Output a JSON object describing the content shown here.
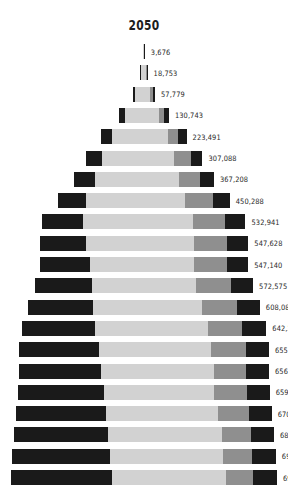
{
  "chart": {
    "title": "2050",
    "axis_center_x": 144,
    "label_gap": 6
  },
  "colors": {
    "background": "#ffffff",
    "segment_dark": "#1a1a1a",
    "segment_light": "#d2d2d2",
    "segment_mid": "#8f8f8f",
    "label_text": "#2a2a2a",
    "title_text": "#1d1d1d"
  },
  "chart_data": {
    "type": "bar",
    "title": "2050",
    "subtitle": "",
    "xlabel": "",
    "ylabel": "",
    "orientation": "horizontal",
    "layout": "centered-pyramid",
    "grid": false,
    "legend": null,
    "axis_ticks": [],
    "xlim": [
      0,
      698304
    ],
    "categories": [
      "row-1",
      "row-2",
      "row-3",
      "row-4",
      "row-5",
      "row-6",
      "row-7",
      "row-8",
      "row-9",
      "row-10",
      "row-11",
      "row-12",
      "row-13",
      "row-14",
      "row-15",
      "row-16",
      "row-17",
      "row-18",
      "row-19",
      "row-20",
      "row-21"
    ],
    "values": [
      3676,
      18753,
      57779,
      130743,
      223491,
      307088,
      367208,
      450288,
      532941,
      547628,
      547140,
      572575,
      608082,
      642222,
      655950,
      656443,
      659946,
      670303,
      682424,
      692165,
      698304
    ],
    "value_labels": [
      "3,676",
      "18,753",
      "57,779",
      "130,743",
      "223,491",
      "307,088",
      "367,208",
      "450,288",
      "532,941",
      "547,628",
      "547,140",
      "572,575",
      "608,082",
      "642,222",
      "655,950",
      "656,443",
      "659,946",
      "670,303",
      "682,424",
      "692,165",
      "698,304"
    ],
    "segment_names": [
      "dark-left",
      "light-middle",
      "mid-gray",
      "dark-right"
    ],
    "segment_fractions": [
      [
        0.0,
        0.74,
        0.0,
        0.26
      ],
      [
        0.1,
        0.66,
        0.1,
        0.14
      ],
      [
        0.11,
        0.66,
        0.13,
        0.1
      ],
      [
        0.11,
        0.7,
        0.1,
        0.09
      ],
      [
        0.12,
        0.66,
        0.12,
        0.1
      ],
      [
        0.14,
        0.62,
        0.14,
        0.1
      ],
      [
        0.15,
        0.6,
        0.15,
        0.1
      ],
      [
        0.16,
        0.58,
        0.16,
        0.1
      ],
      [
        0.2,
        0.54,
        0.16,
        0.1
      ],
      [
        0.22,
        0.52,
        0.16,
        0.1
      ],
      [
        0.24,
        0.5,
        0.16,
        0.1
      ],
      [
        0.26,
        0.48,
        0.16,
        0.1
      ],
      [
        0.28,
        0.47,
        0.15,
        0.1
      ],
      [
        0.3,
        0.46,
        0.14,
        0.1
      ],
      [
        0.32,
        0.45,
        0.14,
        0.09
      ],
      [
        0.33,
        0.45,
        0.13,
        0.09
      ],
      [
        0.34,
        0.44,
        0.13,
        0.09
      ],
      [
        0.35,
        0.44,
        0.12,
        0.09
      ],
      [
        0.36,
        0.44,
        0.11,
        0.09
      ],
      [
        0.37,
        0.43,
        0.11,
        0.09
      ],
      [
        0.38,
        0.43,
        0.1,
        0.09
      ]
    ],
    "row_geometry": {
      "bar_height": 15,
      "row_pitch": 21.3,
      "max_bar_width": 266
    }
  }
}
